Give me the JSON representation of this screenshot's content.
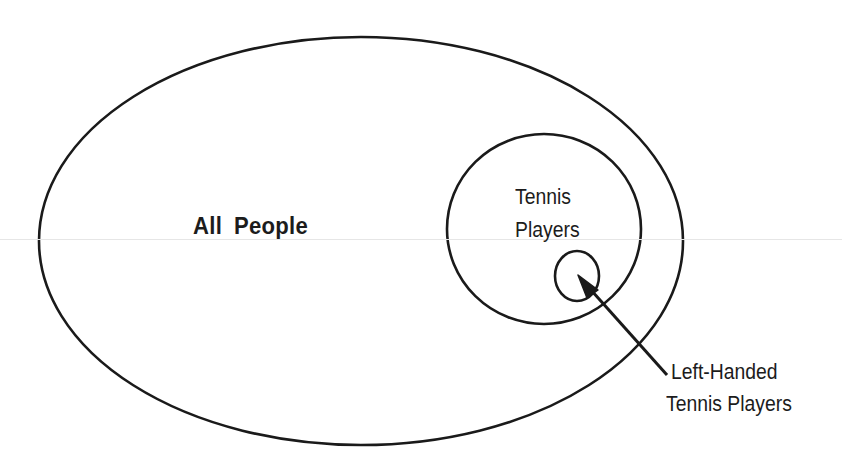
{
  "diagram": {
    "type": "euler-diagram",
    "sets": [
      {
        "id": "all-people",
        "label": "All People",
        "shape": "ellipse",
        "cx": 361,
        "cy": 241,
        "rx": 322,
        "ry": 204,
        "contains": [
          "tennis-players"
        ]
      },
      {
        "id": "tennis-players",
        "label_line1": "Tennis",
        "label_line2": "Players",
        "shape": "ellipse",
        "cx": 544,
        "cy": 229,
        "rx": 97,
        "ry": 95,
        "contains": [
          "left-handed-tennis-players"
        ]
      },
      {
        "id": "left-handed-tennis-players",
        "label_line1": "Left-Handed",
        "label_line2": "Tennis Players",
        "shape": "ellipse",
        "cx": 577,
        "cy": 276,
        "rx": 22,
        "ry": 25,
        "label_placement": "external-with-arrow"
      }
    ],
    "arrow": {
      "from": [
        667,
        375
      ],
      "to": [
        578,
        275
      ],
      "points_to": "left-handed-tennis-players"
    },
    "colors": {
      "stroke": "#1a1a1a",
      "background": "#ffffff",
      "text": "#1c1c1c"
    }
  }
}
